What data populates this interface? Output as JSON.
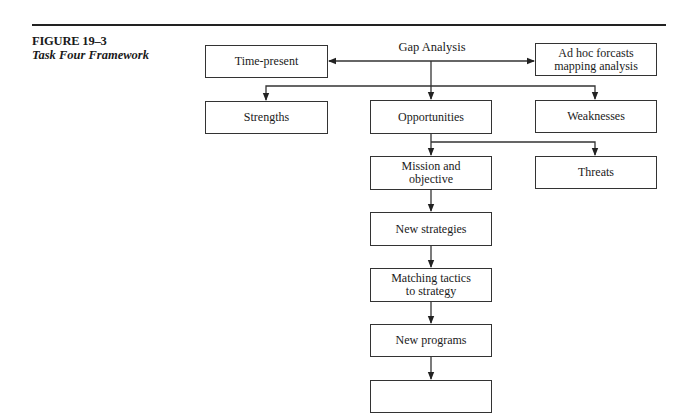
{
  "figure": {
    "number": "FIGURE 19–3",
    "title": "Task Four Framework"
  },
  "diagram": {
    "root_label": "Gap Analysis",
    "nodes": [
      {
        "id": "time-present",
        "label": "Time-present"
      },
      {
        "id": "ad-hoc",
        "label": "Ad hoc forcasts\nmapping analysis"
      },
      {
        "id": "strengths",
        "label": "Strengths"
      },
      {
        "id": "opportunities",
        "label": "Opportunities"
      },
      {
        "id": "weaknesses",
        "label": "Weaknesses"
      },
      {
        "id": "mission",
        "label": "Mission and\nobjective"
      },
      {
        "id": "threats",
        "label": "Threats"
      },
      {
        "id": "new-strategies",
        "label": "New strategies"
      },
      {
        "id": "matching-tactics",
        "label": "Matching tactics\nto strategy"
      },
      {
        "id": "new-programs",
        "label": "New programs"
      },
      {
        "id": "next-step",
        "label": ""
      }
    ],
    "edges": [
      {
        "from": "Gap Analysis",
        "to": "time-present"
      },
      {
        "from": "Gap Analysis",
        "to": "ad-hoc"
      },
      {
        "from": "Gap Analysis",
        "to": "strengths"
      },
      {
        "from": "Gap Analysis",
        "to": "opportunities"
      },
      {
        "from": "Gap Analysis",
        "to": "weaknesses"
      },
      {
        "from": "opportunities",
        "to": "mission"
      },
      {
        "from": "opportunities",
        "to": "threats"
      },
      {
        "from": "mission",
        "to": "new-strategies"
      },
      {
        "from": "new-strategies",
        "to": "matching-tactics"
      },
      {
        "from": "matching-tactics",
        "to": "new-programs"
      },
      {
        "from": "new-programs",
        "to": "next-step"
      }
    ]
  }
}
